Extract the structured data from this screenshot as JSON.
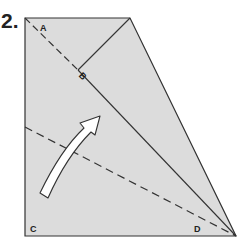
{
  "step": {
    "number": "2."
  },
  "diagram": {
    "colors": {
      "paper": "#dcdcdc",
      "line": "#333333",
      "arrow_fill": "#ffffff"
    },
    "labels": {
      "A": "A",
      "B": "B",
      "C": "C",
      "D": "D"
    }
  }
}
